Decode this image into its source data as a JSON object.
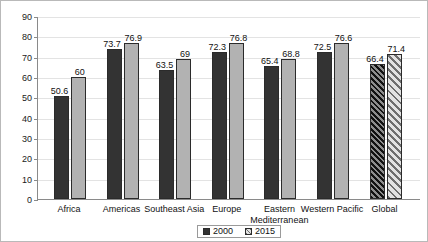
{
  "chart_data": {
    "type": "bar",
    "title": "",
    "subtitle": "",
    "xlabel": "",
    "ylabel": "",
    "ylim": [
      0,
      90
    ],
    "ytick_step": 10,
    "yticks": [
      0,
      10,
      20,
      30,
      40,
      50,
      60,
      70,
      80,
      90
    ],
    "grid": true,
    "legend_position": "bottom-center",
    "categories": [
      "Africa",
      "Americas",
      "Southeast Asia",
      "Europe",
      "Eastern Mediterranean",
      "Western Pacific",
      "Global"
    ],
    "series": [
      {
        "name": "2000",
        "color": "#333333",
        "values": [
          50.6,
          73.7,
          63.5,
          72.3,
          65.4,
          72.5,
          66.4
        ],
        "labels": [
          "50.6",
          "73.7",
          "63.5",
          "72.3",
          "65.4",
          "72.5",
          "66.4"
        ]
      },
      {
        "name": "2015",
        "color": "#b2b2b2",
        "values": [
          60,
          76.9,
          69,
          76.8,
          68.8,
          76.6,
          71.4
        ],
        "labels": [
          "60",
          "76.9",
          "69",
          "76.8",
          "68.8",
          "76.6",
          "71.4"
        ]
      }
    ],
    "highlighted_category": "Global",
    "highlight_style": "diagonal-hatch"
  },
  "legend": {
    "entries": [
      {
        "label": "2000",
        "swatch": "dark-square-swatch"
      },
      {
        "label": "2015",
        "swatch": "hatched-square-swatch"
      }
    ]
  },
  "axis": {
    "y_tick_labels": [
      "90",
      "80",
      "70",
      "60",
      "50",
      "40",
      "30",
      "20",
      "10",
      "0"
    ]
  },
  "category_labels": [
    {
      "line1": "Africa",
      "line2": ""
    },
    {
      "line1": "Americas",
      "line2": ""
    },
    {
      "line1": "Southeast Asia",
      "line2": ""
    },
    {
      "line1": "Europe",
      "line2": ""
    },
    {
      "line1": "Eastern",
      "line2": "Mediterranean"
    },
    {
      "line1": "Western Pacific",
      "line2": ""
    },
    {
      "line1": "Global",
      "line2": ""
    }
  ]
}
